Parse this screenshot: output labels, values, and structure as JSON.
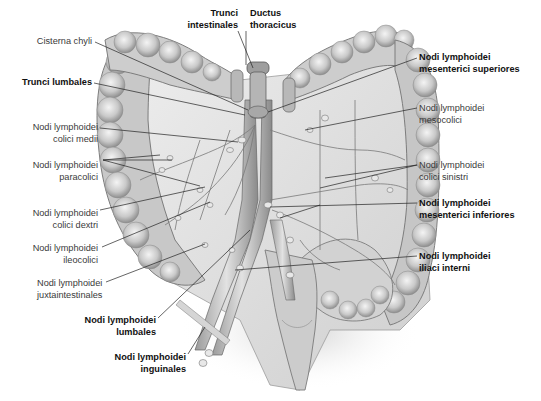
{
  "figure": {
    "colors": {
      "background": "#ffffff",
      "text_regular": "#3a3a3a",
      "text_bold": "#111111",
      "leader_line": "#222222",
      "tissue_light": "#e6e6e6",
      "tissue_mid": "#bdbdbd",
      "tissue_dark": "#8a8a8a"
    }
  },
  "labels": {
    "cisterna_chyli": {
      "lines": [
        "Cisterna chyli"
      ],
      "bold": false
    },
    "trunci_intestinales": {
      "lines": [
        "Trunci",
        "intestinales"
      ],
      "bold": true
    },
    "ductus_thoracicus": {
      "lines": [
        "Ductus",
        "thoracicus"
      ],
      "bold": true
    },
    "trunci_lumbales": {
      "lines": [
        "Trunci lumbales"
      ],
      "bold": true
    },
    "nodi_mesenterici_superiores": {
      "lines": [
        "Nodi lymphoidei",
        "mesenterici superiores"
      ],
      "bold": true
    },
    "nodi_colici_medii": {
      "lines": [
        "Nodi lymphoidei",
        "colici medii"
      ],
      "bold": false
    },
    "nodi_mesocolici": {
      "lines": [
        "Nodi lymphoidei",
        "mesocolici"
      ],
      "bold": false
    },
    "nodi_paracolici": {
      "lines": [
        "Nodi lymphoidei",
        "paracolici"
      ],
      "bold": false
    },
    "nodi_colici_sinistri": {
      "lines": [
        "Nodi lymphoidei",
        "colici sinistri"
      ],
      "bold": false
    },
    "nodi_colici_dextri": {
      "lines": [
        "Nodi lymphoidei",
        "colici dextri"
      ],
      "bold": false
    },
    "nodi_mesenterici_inferiores": {
      "lines": [
        "Nodi lymphoidei",
        "mesenterici inferiores"
      ],
      "bold": true
    },
    "nodi_ileocolici": {
      "lines": [
        "Nodi lymphoidei",
        "ileocolici"
      ],
      "bold": false
    },
    "nodi_iliaci_interni": {
      "lines": [
        "Nodi lymphoidei",
        "iliaci interni"
      ],
      "bold": true
    },
    "nodi_juxtaintestinales": {
      "lines": [
        "Nodi lymphoidei",
        "juxtaintestinales"
      ],
      "bold": false
    },
    "nodi_lumbales": {
      "lines": [
        "Nodi lymphoidei",
        "lumbales"
      ],
      "bold": true
    },
    "nodi_inguinales": {
      "lines": [
        "Nodi lymphoidei",
        "inguinales"
      ],
      "bold": true
    }
  }
}
